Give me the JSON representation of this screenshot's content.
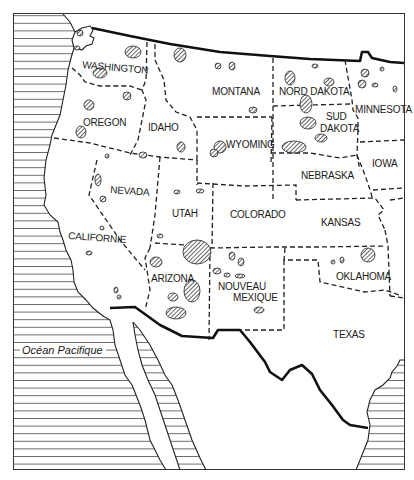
{
  "map": {
    "type": "regional-map",
    "region": "Western United States",
    "legend_pattern": "diagonal-hatched areas",
    "states": [
      {
        "id": "washington",
        "label": "WASHINGTON"
      },
      {
        "id": "oregon",
        "label": "OREGON"
      },
      {
        "id": "idaho",
        "label": "IDAHO"
      },
      {
        "id": "montana",
        "label": "MONTANA"
      },
      {
        "id": "nord-dakota",
        "label": "NORD DAKOTA"
      },
      {
        "id": "sud-dakota-1",
        "label": "SUD"
      },
      {
        "id": "sud-dakota-2",
        "label": "DAKOTA"
      },
      {
        "id": "minnesota",
        "label": "MINNESOTA"
      },
      {
        "id": "wyoming",
        "label": "WYOMING"
      },
      {
        "id": "iowa",
        "label": "IOWA"
      },
      {
        "id": "nebraska",
        "label": "NEBRASKA"
      },
      {
        "id": "nevada",
        "label": "NEVADA"
      },
      {
        "id": "utah",
        "label": "UTAH"
      },
      {
        "id": "colorado",
        "label": "COLORADO"
      },
      {
        "id": "kansas",
        "label": "KANSAS"
      },
      {
        "id": "californie",
        "label": "CALIFORNIE"
      },
      {
        "id": "arizona",
        "label": "ARIZONA"
      },
      {
        "id": "nouveau-mexique-1",
        "label": "NOUVEAU"
      },
      {
        "id": "nouveau-mexique-2",
        "label": "MEXIQUE"
      },
      {
        "id": "oklahoma",
        "label": "OKLAHOMA"
      },
      {
        "id": "texas",
        "label": "TEXAS"
      }
    ],
    "water_bodies": [
      {
        "id": "pacific",
        "label": "Océan Pacifique"
      }
    ],
    "colors": {
      "ink": "#1a1a1a",
      "background": "#ffffff"
    }
  }
}
